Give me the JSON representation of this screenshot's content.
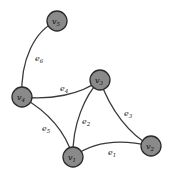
{
  "graph": {
    "nodes": [
      {
        "id": "v1",
        "label": "v",
        "sub": "1",
        "x": 73,
        "y": 157
      },
      {
        "id": "v2",
        "label": "v",
        "sub": "2",
        "x": 151,
        "y": 146
      },
      {
        "id": "v3",
        "label": "v",
        "sub": "3",
        "x": 100,
        "y": 80
      },
      {
        "id": "v4",
        "label": "v",
        "sub": "4",
        "x": 22,
        "y": 97
      },
      {
        "id": "v5",
        "label": "v",
        "sub": "5",
        "x": 57,
        "y": 21
      }
    ],
    "edges": [
      {
        "id": "e1",
        "label": "e",
        "sub": "1",
        "from": "v1",
        "to": "v2"
      },
      {
        "id": "e2",
        "label": "e",
        "sub": "2",
        "from": "v1",
        "to": "v3"
      },
      {
        "id": "e3",
        "label": "e",
        "sub": "3",
        "from": "v3",
        "to": "v2"
      },
      {
        "id": "e4",
        "label": "e",
        "sub": "4",
        "from": "v4",
        "to": "v3"
      },
      {
        "id": "e5",
        "label": "e",
        "sub": "5",
        "from": "v4",
        "to": "v1"
      },
      {
        "id": "e6",
        "label": "e",
        "sub": "6",
        "from": "v4",
        "to": "v5"
      }
    ]
  },
  "colors": {
    "node_fill": "#8a8a8a",
    "node_stroke": "#2a2a2a",
    "edge": "#3a3a3a"
  }
}
